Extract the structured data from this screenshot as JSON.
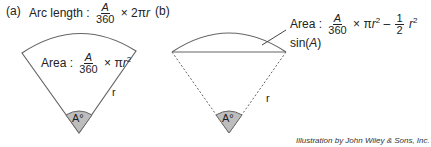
{
  "panel_a": {
    "tag": "(a)",
    "arc_length": {
      "prefix": "Arc length : ",
      "num": "A",
      "den": "360",
      "suffix": " × 2π",
      "var": "r"
    },
    "area": {
      "prefix": "Area : ",
      "num": "A",
      "den": "360",
      "suffix": " × π",
      "var": "r",
      "exp": "2"
    },
    "radius_label": "r",
    "angle_label": "A°"
  },
  "panel_b": {
    "tag": "(b)",
    "area": {
      "prefix": "Area : ",
      "num": "A",
      "den": "360",
      "mid": " × π",
      "var": "r",
      "exp": "2",
      "minus": " – ",
      "num2": "1",
      "den2": "2",
      "tail_var": "r",
      "tail_exp": "2",
      "tail": " sin(",
      "tail_arg": "A",
      "tail_close": ")"
    },
    "radius_label": "r",
    "angle_label": "A°"
  },
  "credit": "Illustration by John Wiley & Sons, Inc.",
  "colors": {
    "line": "#666666",
    "wedge_fill": "#bdbdbd",
    "text": "#222222"
  }
}
